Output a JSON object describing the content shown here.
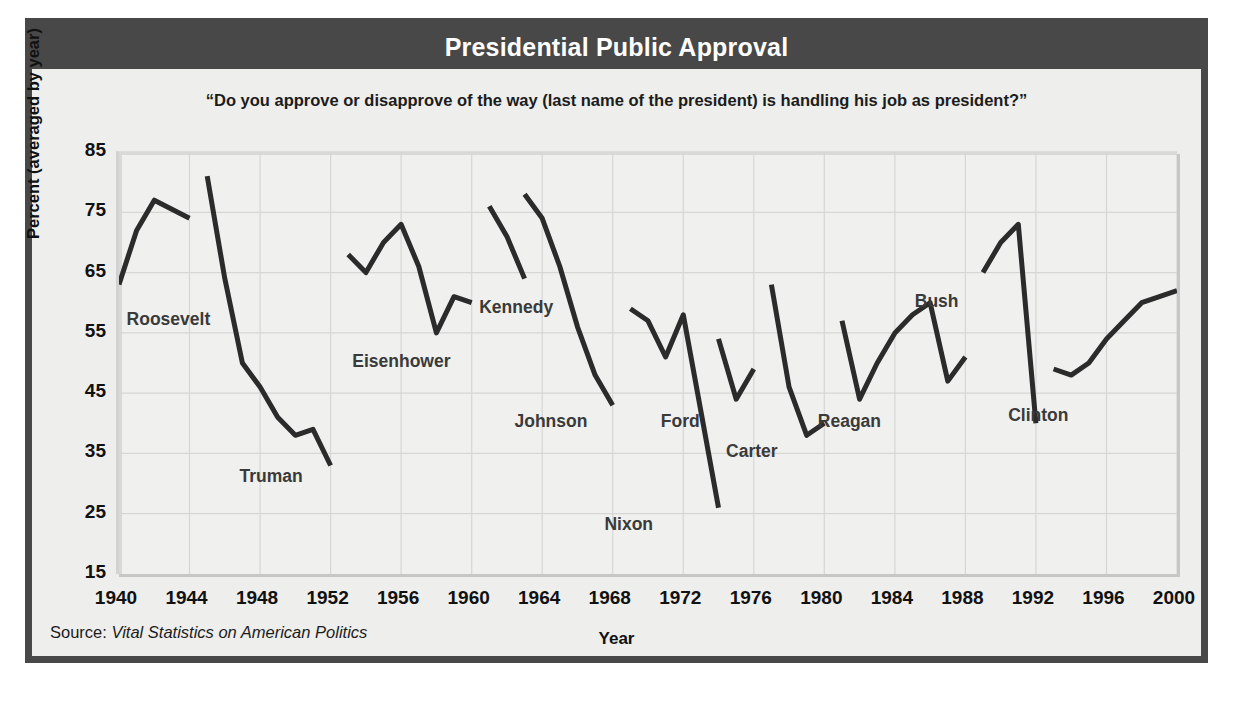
{
  "title": "Presidential Public Approval",
  "question": "“Do you approve or disapprove of the way (last name of the president) is handling his job as president?”",
  "source": {
    "prefix": "Source: ",
    "italic": "Vital Statistics on American Politics"
  },
  "colors": {
    "frame": "#484848",
    "title_bar": "#484848",
    "title_text": "#ffffff",
    "plot_background": "#f0f0ee",
    "grid": "#d6d6d4",
    "line": "#2b2b2b",
    "label_text": "#3a3a3a",
    "axis_text": "#111111"
  },
  "chart_data": {
    "type": "line",
    "title": "Presidential Public Approval",
    "subtitle": "“Do you approve or disapprove of the way (last name of the president) is handling his job as president?”",
    "xlabel": "Year",
    "ylabel": "Percent (averaged by year)",
    "xlim": [
      1940,
      2000
    ],
    "ylim": [
      15,
      85
    ],
    "xticks": [
      1940,
      1944,
      1948,
      1952,
      1956,
      1960,
      1964,
      1968,
      1972,
      1976,
      1980,
      1984,
      1988,
      1992,
      1996,
      2000
    ],
    "yticks": [
      15,
      25,
      35,
      45,
      55,
      65,
      75,
      85
    ],
    "grid": true,
    "legend": "inline-labels",
    "series": [
      {
        "name": "Roosevelt",
        "label_x": 1940.6,
        "label_y": 57.0,
        "x": [
          1940,
          1941,
          1942,
          1944
        ],
        "values": [
          63,
          72,
          77,
          74
        ]
      },
      {
        "name": "Truman",
        "label_x": 1947.0,
        "label_y": 31.0,
        "x": [
          1945,
          1946,
          1947,
          1948,
          1949,
          1950,
          1951,
          1952
        ],
        "values": [
          81,
          64,
          50,
          46,
          41,
          38,
          39,
          33
        ]
      },
      {
        "name": "Eisenhower",
        "label_x": 1953.4,
        "label_y": 50.0,
        "x": [
          1953,
          1954,
          1955,
          1956,
          1957,
          1958,
          1959,
          1960
        ],
        "values": [
          68,
          65,
          70,
          73,
          66,
          55,
          61,
          60
        ]
      },
      {
        "name": "Kennedy",
        "label_x": 1960.6,
        "label_y": 59.0,
        "x": [
          1961,
          1962,
          1963
        ],
        "values": [
          76,
          71,
          64
        ]
      },
      {
        "name": "Johnson",
        "label_x": 1962.6,
        "label_y": 40.0,
        "x": [
          1963,
          1964,
          1965,
          1966,
          1967,
          1968
        ],
        "values": [
          78,
          74,
          66,
          56,
          48,
          43
        ]
      },
      {
        "name": "Nixon",
        "label_x": 1967.7,
        "label_y": 23.0,
        "x": [
          1969,
          1970,
          1971,
          1972,
          1973,
          1974
        ],
        "values": [
          59,
          57,
          51,
          58,
          42,
          26
        ]
      },
      {
        "name": "Ford",
        "label_x": 1970.9,
        "label_y": 40.0,
        "x": [
          1974,
          1975,
          1976
        ],
        "values": [
          54,
          44,
          49
        ]
      },
      {
        "name": "Carter",
        "label_x": 1974.6,
        "label_y": 35.0,
        "x": [
          1977,
          1978,
          1979,
          1980
        ],
        "values": [
          63,
          46,
          38,
          40
        ]
      },
      {
        "name": "Reagan",
        "label_x": 1979.8,
        "label_y": 40.0,
        "x": [
          1981,
          1982,
          1983,
          1984,
          1985,
          1986,
          1987,
          1988
        ],
        "values": [
          57,
          44,
          50,
          55,
          58,
          60,
          47,
          51
        ]
      },
      {
        "name": "Bush",
        "label_x": 1985.3,
        "label_y": 60.0,
        "x": [
          1989,
          1990,
          1991,
          1992
        ],
        "values": [
          65,
          70,
          73,
          40
        ]
      },
      {
        "name": "Clinton",
        "label_x": 1990.6,
        "label_y": 41.0,
        "x": [
          1993,
          1994,
          1995,
          1996,
          1997,
          1998,
          1999,
          2000
        ],
        "values": [
          49,
          48,
          50,
          54,
          57,
          60,
          61,
          62
        ]
      }
    ]
  }
}
